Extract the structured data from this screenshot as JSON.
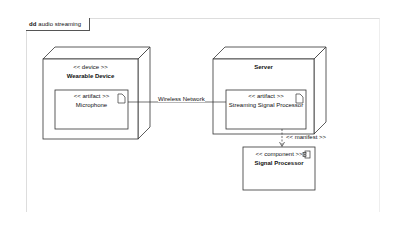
{
  "frame": {
    "kind": "dd",
    "title": "audio streaming"
  },
  "nodes": [
    {
      "id": "wearable",
      "stereotype": "<< device >>",
      "name": "Wearable Device"
    },
    {
      "id": "server",
      "stereotype": "",
      "name": "Server"
    }
  ],
  "artifacts": [
    {
      "id": "microphone",
      "stereotype": "<< artifact >>",
      "name": "Microphone"
    },
    {
      "id": "ssp",
      "stereotype": "<< artifact >>",
      "name": "Streaming Signal Processor"
    }
  ],
  "components": [
    {
      "id": "sp",
      "stereotype": "<< component >>",
      "name": "Signal Processor"
    }
  ],
  "connections": [
    {
      "from": "microphone",
      "to": "ssp",
      "label": "Wireless Network"
    },
    {
      "from": "ssp",
      "to": "sp",
      "label": "<< manifest >>",
      "style": "dashed"
    }
  ]
}
